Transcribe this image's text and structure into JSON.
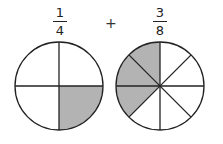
{
  "fractions": [
    {
      "numerator": "1",
      "denominator": "4"
    },
    {
      "numerator": "3",
      "denominator": "8"
    }
  ],
  "operator": "+",
  "circles": [
    {
      "parts": 4,
      "shaded": 1
    },
    {
      "parts": 8,
      "shaded": 3
    }
  ],
  "colors": {
    "shade": "#b3b3b3",
    "stroke": "#222222",
    "background": "#ffffff"
  }
}
